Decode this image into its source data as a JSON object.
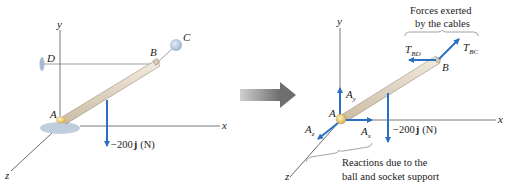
{
  "colors": {
    "force_blue": "#2a6fc4",
    "axis": "#555555",
    "rod": "#e2d6c4",
    "rod_edge": "#8a7d6a",
    "support": "#b8c8dc",
    "joint": "#e8c66a",
    "transition_arrow": "#8c8c8c"
  },
  "left_figure": {
    "axes": {
      "x": "x",
      "y": "y",
      "z": "z"
    },
    "points": {
      "A": "A",
      "B": "B",
      "C": "C",
      "D": "D"
    },
    "load": {
      "prefix": "−200",
      "unit_vector": "j",
      "unit": "(N)"
    }
  },
  "transition_arrow": {
    "icon": "right-arrow-icon"
  },
  "right_figure": {
    "axes": {
      "x": "x",
      "y": "y",
      "z": "z"
    },
    "points": {
      "A": "A",
      "B": "B"
    },
    "cable_forces": [
      {
        "symbol": "T",
        "subscript": "BD"
      },
      {
        "symbol": "T",
        "subscript": "BC"
      }
    ],
    "reactions": [
      {
        "symbol": "A",
        "subscript": "x"
      },
      {
        "symbol": "A",
        "subscript": "y"
      },
      {
        "symbol": "A",
        "subscript": "z"
      }
    ],
    "load": {
      "prefix": "−200",
      "unit_vector": "j",
      "unit": "(N)"
    },
    "annotations": {
      "cables_line1": "Forces exerted",
      "cables_line2": "by the cables",
      "reactions_line1": "Reactions due to the",
      "reactions_line2": "ball and socket support"
    }
  }
}
